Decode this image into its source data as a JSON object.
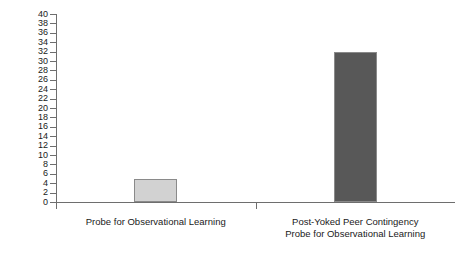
{
  "chart_data": {
    "type": "bar",
    "title": "",
    "subtitle": "",
    "xlabel": "",
    "ylabel": "Number of Correct Textual Responses",
    "categories": [
      "Probe for Observational Learning",
      "Post-Yoked Peer Contingency\nProbe for Observational Learning"
    ],
    "values": [
      5,
      32
    ],
    "ylim": [
      0,
      40
    ],
    "ytick_step": 2,
    "yticks": [
      0,
      2,
      4,
      6,
      8,
      10,
      12,
      14,
      16,
      18,
      20,
      22,
      24,
      26,
      28,
      30,
      32,
      34,
      36,
      38,
      40
    ],
    "ytick_labels": [
      "0",
      "2",
      "4",
      "6",
      "8",
      "10",
      "12",
      "14",
      "16",
      "18",
      "20",
      "22",
      "24",
      "26",
      "28",
      "30",
      "32",
      "34",
      "36",
      "38",
      "40"
    ],
    "grid": false,
    "legend": false,
    "legend_position": "none",
    "bar_colors": [
      "#d2d2d2",
      "#585858"
    ],
    "bar_edge_color": "#8a8a8a",
    "axis_color": "#6e6e6e",
    "background": "#ffffff",
    "series": [
      {
        "name": "Number of Correct Textual Responses",
        "values": [
          5,
          32
        ]
      }
    ]
  }
}
